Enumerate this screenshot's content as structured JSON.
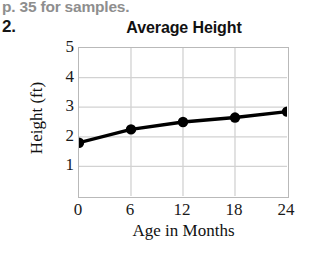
{
  "page": {
    "note_text": "p. 35 for samples.",
    "problem_number": "2.",
    "note_color": "#8e8e8e"
  },
  "chart_data": {
    "type": "line",
    "title": "Average Height",
    "xlabel": "Age in Months",
    "ylabel": "Height (ft)",
    "x": [
      0,
      6,
      12,
      18,
      24
    ],
    "values": [
      1.8,
      2.25,
      2.5,
      2.65,
      2.85
    ],
    "xticks": [
      "0",
      "6",
      "12",
      "18",
      "24"
    ],
    "yticks": [
      "1",
      "2",
      "3",
      "4",
      "5"
    ],
    "xlim": [
      0,
      24
    ],
    "ylim": [
      0,
      5
    ],
    "grid": true,
    "legend": "none",
    "marker": "filled-circle",
    "line_color": "#000000",
    "marker_color": "#000000",
    "grid_color": "#d2d2d2",
    "axis_color": "#b9b9b9",
    "background": "#ffffff"
  }
}
